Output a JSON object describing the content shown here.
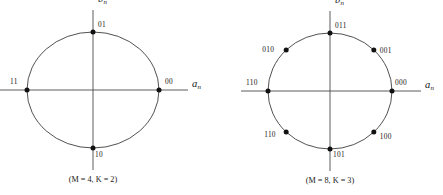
{
  "figure": {
    "background_color": "#ffffff",
    "line_color": "#3d3d3d",
    "dot_color": "#111111",
    "text_color": "#1a1a1a",
    "diagrams": [
      {
        "id": "psk-4",
        "caption": "(M = 4, K = 2)",
        "caption_m_symbol": "M",
        "caption_k_symbol": "K",
        "caption_m_value": "4",
        "caption_k_value": "2",
        "x_axis_label_base": "a",
        "x_axis_label_sub": "n",
        "y_axis_label_base": "b",
        "y_axis_label_sub": "n",
        "center_x": 93,
        "center_y": 90,
        "radius_x": 66,
        "radius_y": 58,
        "points": [
          {
            "label": "00",
            "angle_deg": 0,
            "label_dx": 6,
            "label_dy": -12
          },
          {
            "label": "01",
            "angle_deg": 90,
            "label_dx": 5,
            "label_dy": -11
          },
          {
            "label": "11",
            "angle_deg": 180,
            "label_dx": -17,
            "label_dy": -12
          },
          {
            "label": "10",
            "angle_deg": 270,
            "label_dx": 2,
            "label_dy": 3
          }
        ]
      },
      {
        "id": "psk-8",
        "caption": "(M = 8, K = 3)",
        "caption_m_symbol": "M",
        "caption_k_symbol": "K",
        "caption_m_value": "8",
        "caption_k_value": "3",
        "x_axis_label_base": "a",
        "x_axis_label_sub": "n",
        "y_axis_label_base": "b",
        "y_axis_label_sub": "n",
        "center_x": 330,
        "center_y": 91,
        "radius_x": 62,
        "radius_y": 58,
        "points": [
          {
            "label": "000",
            "angle_deg": 0,
            "label_dx": 3,
            "label_dy": -12
          },
          {
            "label": "001",
            "angle_deg": 45,
            "label_dx": 6,
            "label_dy": -3
          },
          {
            "label": "011",
            "angle_deg": 90,
            "label_dx": 5,
            "label_dy": -11
          },
          {
            "label": "010",
            "angle_deg": 135,
            "label_dx": -24,
            "label_dy": -4
          },
          {
            "label": "110",
            "angle_deg": 180,
            "label_dx": -22,
            "label_dy": -12
          },
          {
            "label": "110",
            "angle_deg": 225,
            "label_dx": -22,
            "label_dy": -1
          },
          {
            "label": "101",
            "angle_deg": 270,
            "label_dx": 3,
            "label_dy": 2
          },
          {
            "label": "100",
            "angle_deg": 315,
            "label_dx": 6,
            "label_dy": 1
          }
        ]
      }
    ]
  }
}
